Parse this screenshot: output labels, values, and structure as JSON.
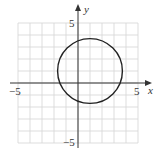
{
  "chart_data": {
    "type": "line",
    "title": "",
    "xlabel": "x",
    "ylabel": "y",
    "xlim": [
      -5,
      5
    ],
    "ylim": [
      -5,
      5
    ],
    "grid": true,
    "grid_step": 1,
    "x_tick_labels": [
      {
        "value": -5,
        "label": "−5"
      },
      {
        "value": 5,
        "label": "5"
      }
    ],
    "y_tick_labels": [
      {
        "value": 5,
        "label": "5"
      },
      {
        "value": -5,
        "label": "−5"
      }
    ],
    "series": [
      {
        "name": "circle",
        "shape": "circle",
        "center": [
          1,
          1
        ],
        "radius": 2.7,
        "color": "#222222"
      }
    ],
    "legend": null
  },
  "colors": {
    "grid": "#d4d4d4",
    "axis": "#333333",
    "curve": "#222222"
  },
  "labels": {
    "x_axis": "x",
    "y_axis": "y",
    "x_min": "−5",
    "x_max": "5",
    "y_max": "5",
    "y_min": "−5"
  }
}
